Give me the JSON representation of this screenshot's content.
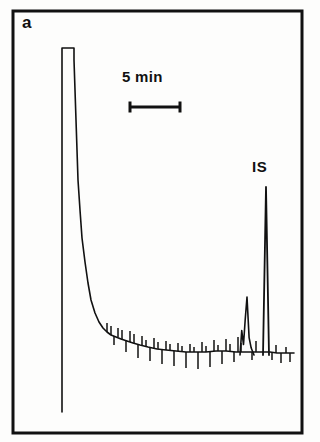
{
  "figure": {
    "panel_label": "a",
    "background_color": "#fdfdfc",
    "ink_color": "#111111",
    "frame": {
      "x": 13,
      "y": 11,
      "width": 289,
      "height": 422,
      "stroke_width": 3
    }
  },
  "annotations": {
    "scale_bar_label": "5 min",
    "internal_standard_label": "IS"
  },
  "chart_data": {
    "type": "line",
    "title": "",
    "subtitle": "",
    "xlabel": "",
    "ylabel": "",
    "grid": false,
    "legend_position": "none",
    "axis_visible": false,
    "xlim": [
      0,
      100
    ],
    "ylim": [
      0,
      100
    ],
    "annotations": [
      {
        "name": "scale-bar",
        "label": "5 min",
        "type": "horizontal-scale-bar",
        "x_start": 130,
        "x_end": 180,
        "y": 107,
        "cap_height": 11,
        "label_x": 155,
        "label_y": 78
      },
      {
        "name": "is-peak-label",
        "label": "IS",
        "type": "peak-label",
        "x": 266,
        "y": 168
      }
    ],
    "baseline": {
      "y_px": 352,
      "x_start_px": 105,
      "x_end_px": 294
    },
    "peaks": [
      {
        "name": "solvent-peak",
        "label": "",
        "x_px": 68,
        "apex_y_px": 48,
        "base_y_px": 412,
        "width_px": 12,
        "clipped": true,
        "note": "off-scale flat-topped solvent front"
      },
      {
        "name": "analyte-peak-cluster",
        "label": "",
        "x_px": 247,
        "apex_y_px": 297,
        "base_y_px": 355,
        "width_px": 14,
        "clipped": false
      },
      {
        "name": "internal-standard-peak",
        "label": "IS",
        "x_px": 266,
        "apex_y_px": 187,
        "base_y_px": 355,
        "width_px": 6,
        "clipped": false
      }
    ],
    "series": [
      {
        "name": "detector-signal",
        "color": "#111111",
        "line_width": 1.6,
        "points_px": [
          [
            62,
            412
          ],
          [
            62,
            48
          ],
          [
            74,
            48
          ],
          [
            74,
            60
          ],
          [
            75,
            90
          ],
          [
            76,
            120
          ],
          [
            77,
            150
          ],
          [
            78,
            180
          ],
          [
            80,
            210
          ],
          [
            82,
            238
          ],
          [
            85,
            262
          ],
          [
            88,
            283
          ],
          [
            91,
            300
          ],
          [
            95,
            313
          ],
          [
            99,
            322
          ],
          [
            103,
            328
          ],
          [
            107,
            332
          ],
          [
            111,
            335
          ],
          [
            116,
            337
          ],
          [
            121,
            339
          ],
          [
            127,
            341
          ],
          [
            133,
            343
          ],
          [
            140,
            345
          ],
          [
            148,
            347
          ],
          [
            157,
            349
          ],
          [
            166,
            350
          ],
          [
            176,
            351
          ],
          [
            186,
            352
          ],
          [
            196,
            352
          ],
          [
            206,
            352
          ],
          [
            216,
            351
          ],
          [
            226,
            351
          ],
          [
            236,
            352
          ],
          [
            244,
            352
          ],
          [
            252,
            352
          ],
          [
            258,
            352
          ],
          [
            263,
            352
          ],
          [
            270,
            352
          ],
          [
            277,
            353
          ],
          [
            284,
            353
          ],
          [
            290,
            353
          ],
          [
            294,
            353
          ]
        ]
      }
    ],
    "noise_spikes_px": [
      [
        107,
        332,
        323
      ],
      [
        111,
        335,
        326
      ],
      [
        114,
        336,
        345
      ],
      [
        118,
        337,
        328
      ],
      [
        122,
        339,
        330
      ],
      [
        126,
        340,
        352
      ],
      [
        130,
        342,
        331
      ],
      [
        134,
        343,
        334
      ],
      [
        138,
        344,
        358
      ],
      [
        142,
        345,
        336
      ],
      [
        146,
        346,
        340
      ],
      [
        150,
        347,
        361
      ],
      [
        154,
        348,
        338
      ],
      [
        158,
        349,
        342
      ],
      [
        162,
        350,
        364
      ],
      [
        166,
        350,
        341
      ],
      [
        170,
        351,
        344
      ],
      [
        174,
        351,
        366
      ],
      [
        178,
        351,
        343
      ],
      [
        182,
        352,
        346
      ],
      [
        186,
        352,
        368
      ],
      [
        190,
        352,
        344
      ],
      [
        194,
        352,
        347
      ],
      [
        198,
        352,
        369
      ],
      [
        202,
        352,
        342
      ],
      [
        206,
        352,
        346
      ],
      [
        210,
        351,
        367
      ],
      [
        214,
        351,
        340
      ],
      [
        218,
        351,
        345
      ],
      [
        222,
        351,
        364
      ],
      [
        226,
        351,
        339
      ],
      [
        230,
        351,
        344
      ],
      [
        234,
        352,
        362
      ],
      [
        238,
        352,
        337
      ],
      [
        241,
        352,
        343
      ],
      [
        252,
        352,
        360
      ],
      [
        256,
        352,
        341
      ],
      [
        272,
        352,
        360
      ],
      [
        276,
        353,
        345
      ],
      [
        281,
        353,
        363
      ],
      [
        286,
        353,
        347
      ],
      [
        290,
        353,
        362
      ]
    ]
  }
}
